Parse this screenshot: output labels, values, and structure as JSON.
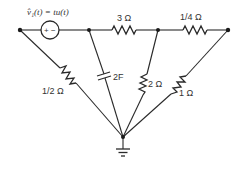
{
  "diagram": {
    "type": "circuit",
    "source": {
      "label": "v̂₁(t) = tu(t)",
      "polarity_plus": "+",
      "polarity_minus": "−"
    },
    "components": [
      {
        "id": "R3",
        "label": "3 Ω",
        "type": "resistor"
      },
      {
        "id": "R14",
        "label": "1/4 Ω",
        "type": "resistor"
      },
      {
        "id": "R12",
        "label": "1/2 Ω",
        "type": "resistor"
      },
      {
        "id": "C2",
        "label": "2F",
        "type": "capacitor"
      },
      {
        "id": "R2",
        "label": "2 Ω",
        "type": "resistor"
      },
      {
        "id": "R1",
        "label": "1 Ω",
        "type": "resistor"
      }
    ],
    "ground": {
      "label": ""
    },
    "colors": {
      "line": "#2a2a2a",
      "background": "#ffffff"
    }
  }
}
